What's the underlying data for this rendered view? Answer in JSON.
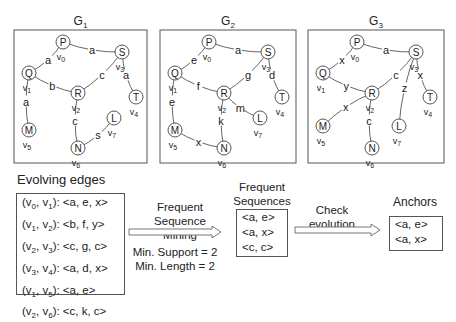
{
  "graphs": [
    {
      "title": "G",
      "subscript": "1",
      "nodes": [
        {
          "id": "v0",
          "label": "P",
          "sub": "v",
          "subidx": "0"
        },
        {
          "id": "v1",
          "label": "Q",
          "sub": "v",
          "subidx": "1"
        },
        {
          "id": "v2",
          "label": "R",
          "sub": "v",
          "subidx": "2"
        },
        {
          "id": "v3",
          "label": "S",
          "sub": "v",
          "subidx": "3"
        },
        {
          "id": "v4",
          "label": "T",
          "sub": "v",
          "subidx": "4"
        },
        {
          "id": "v5",
          "label": "M",
          "sub": "v",
          "subidx": "5"
        },
        {
          "id": "v6",
          "label": "N",
          "sub": "v",
          "subidx": "6"
        },
        {
          "id": "v7",
          "label": "L",
          "sub": "v",
          "subidx": "7"
        }
      ],
      "edges": [
        {
          "from": "v1",
          "to": "v0",
          "label": "a"
        },
        {
          "from": "v0",
          "to": "v3",
          "label": "a"
        },
        {
          "from": "v1",
          "to": "v2",
          "label": "b"
        },
        {
          "from": "v2",
          "to": "v3",
          "label": "c"
        },
        {
          "from": "v3",
          "to": "v4",
          "label": "a"
        },
        {
          "from": "v1",
          "to": "v5",
          "label": "a"
        },
        {
          "from": "v2",
          "to": "v6",
          "label": "c"
        },
        {
          "from": "v6",
          "to": "v7",
          "label": "s"
        }
      ]
    },
    {
      "title": "G",
      "subscript": "2",
      "nodes": [
        {
          "id": "v0",
          "label": "P",
          "sub": "v",
          "subidx": "0"
        },
        {
          "id": "v1",
          "label": "Q",
          "sub": "v",
          "subidx": "1"
        },
        {
          "id": "v2",
          "label": "R",
          "sub": "v",
          "subidx": "2"
        },
        {
          "id": "v3",
          "label": "S",
          "sub": "v",
          "subidx": "3"
        },
        {
          "id": "v4",
          "label": "T",
          "sub": "v",
          "subidx": "4"
        },
        {
          "id": "v5",
          "label": "M",
          "sub": "v",
          "subidx": "5"
        },
        {
          "id": "v6",
          "label": "N",
          "sub": "v",
          "subidx": "6"
        },
        {
          "id": "v7",
          "label": "L",
          "sub": "v",
          "subidx": "7"
        }
      ],
      "edges": [
        {
          "from": "v1",
          "to": "v0",
          "label": "e"
        },
        {
          "from": "v0",
          "to": "v3",
          "label": "a"
        },
        {
          "from": "v1",
          "to": "v2",
          "label": "f"
        },
        {
          "from": "v2",
          "to": "v3",
          "label": "g"
        },
        {
          "from": "v3",
          "to": "v4",
          "label": "d"
        },
        {
          "from": "v1",
          "to": "v5",
          "label": "e"
        },
        {
          "from": "v2",
          "to": "v6",
          "label": "k"
        },
        {
          "from": "v5",
          "to": "v6",
          "label": "x"
        },
        {
          "from": "v2",
          "to": "v7",
          "label": "m"
        }
      ]
    },
    {
      "title": "G",
      "subscript": "3",
      "nodes": [
        {
          "id": "v0",
          "label": "P",
          "sub": "v",
          "subidx": "0"
        },
        {
          "id": "v1",
          "label": "Q",
          "sub": "v",
          "subidx": "1"
        },
        {
          "id": "v2",
          "label": "R",
          "sub": "v",
          "subidx": "2"
        },
        {
          "id": "v3",
          "label": "S",
          "sub": "v",
          "subidx": "3"
        },
        {
          "id": "v4",
          "label": "T",
          "sub": "v",
          "subidx": "4"
        },
        {
          "id": "v5",
          "label": "M",
          "sub": "v",
          "subidx": "5"
        },
        {
          "id": "v6",
          "label": "N",
          "sub": "v",
          "subidx": "6"
        },
        {
          "id": "v7",
          "label": "L",
          "sub": "v",
          "subidx": "7"
        }
      ],
      "edges": [
        {
          "from": "v1",
          "to": "v0",
          "label": "x"
        },
        {
          "from": "v0",
          "to": "v3",
          "label": "a"
        },
        {
          "from": "v1",
          "to": "v2",
          "label": "y"
        },
        {
          "from": "v2",
          "to": "v3",
          "label": "c"
        },
        {
          "from": "v3",
          "to": "v4",
          "label": "x"
        },
        {
          "from": "v2",
          "to": "v5",
          "label": "x"
        },
        {
          "from": "v2",
          "to": "v6",
          "label": "c"
        },
        {
          "from": "v3",
          "to": "v7",
          "label": "z"
        }
      ]
    }
  ],
  "evolving_edges": {
    "heading": "Evolving edges",
    "rows": [
      {
        "pair_a": "v",
        "ia": "0",
        "pair_b": "v",
        "ib": "1",
        "seq": "<a, e, x>"
      },
      {
        "pair_a": "v",
        "ia": "1",
        "pair_b": "v",
        "ib": "2",
        "seq": "<b, f, y>"
      },
      {
        "pair_a": "v",
        "ia": "2",
        "pair_b": "v",
        "ib": "3",
        "seq": "<c, g, c>"
      },
      {
        "pair_a": "v",
        "ia": "3",
        "pair_b": "v",
        "ib": "4",
        "seq": "<a, d, x>"
      },
      {
        "pair_a": "v",
        "ia": "1",
        "pair_b": "v",
        "ib": "5",
        "seq": "<a, e>"
      },
      {
        "pair_a": "v",
        "ia": "2",
        "pair_b": "v",
        "ib": "6",
        "seq": "<c, k, c>"
      }
    ]
  },
  "mining_step": {
    "label_lines": [
      "Frequent",
      "Sequence",
      "Mining"
    ],
    "params": [
      "Min. Support = 2",
      "Min. Length = 2"
    ]
  },
  "frequent_sequences": {
    "heading_lines": [
      "Frequent",
      "Sequences"
    ],
    "items": [
      "<a, e>",
      "<a, x>",
      "<c, c>"
    ]
  },
  "evolution_step": {
    "label_lines": [
      "Check",
      "evolution"
    ]
  },
  "anchors": {
    "heading": "Anchors",
    "items": [
      "<a, e>",
      "<a, x>"
    ]
  }
}
